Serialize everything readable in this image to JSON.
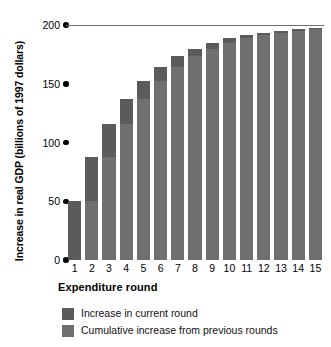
{
  "chart_data": {
    "type": "bar",
    "title": "",
    "subtitle": "",
    "xlabel": "Expenditure round",
    "ylabel": "Increase in real GDP (billions of 1997 dollars)",
    "categories": [
      "1",
      "2",
      "3",
      "4",
      "5",
      "6",
      "7",
      "8",
      "9",
      "10",
      "11",
      "12",
      "13",
      "14",
      "15"
    ],
    "ylim": [
      0,
      200
    ],
    "yticks": [
      0,
      50,
      100,
      150,
      200
    ],
    "ytick_labels": [
      "0",
      "50",
      "100",
      "150",
      "200"
    ],
    "grid": false,
    "legend_position": "below",
    "stacked": true,
    "reference_line": {
      "value": 200,
      "color": "#6e6e6e"
    },
    "series": [
      {
        "name": "Cumulative increase from previous rounds",
        "color": "#6f6f6f",
        "values": [
          0,
          50,
          87.5,
          115.6,
          136.7,
          152.5,
          164.4,
          173.3,
          180.0,
          185.0,
          188.7,
          191.5,
          193.6,
          195.2,
          196.4
        ]
      },
      {
        "name": "Increase in current round",
        "color": "#5b5b5b",
        "values": [
          50,
          37.5,
          28.1,
          21.1,
          15.8,
          11.9,
          8.9,
          6.7,
          5.0,
          3.7,
          2.8,
          2.1,
          1.6,
          1.2,
          0.9
        ]
      }
    ],
    "totals": [
      50,
      87.5,
      115.6,
      136.7,
      152.5,
      164.4,
      173.3,
      180.0,
      185.0,
      188.7,
      191.5,
      193.6,
      195.2,
      196.4,
      197.3
    ]
  },
  "legend": {
    "items": [
      {
        "label": "Increase in current round",
        "color": "#5b5b5b"
      },
      {
        "label": "Cumulative increase from previous rounds",
        "color": "#6f6f6f"
      }
    ]
  }
}
